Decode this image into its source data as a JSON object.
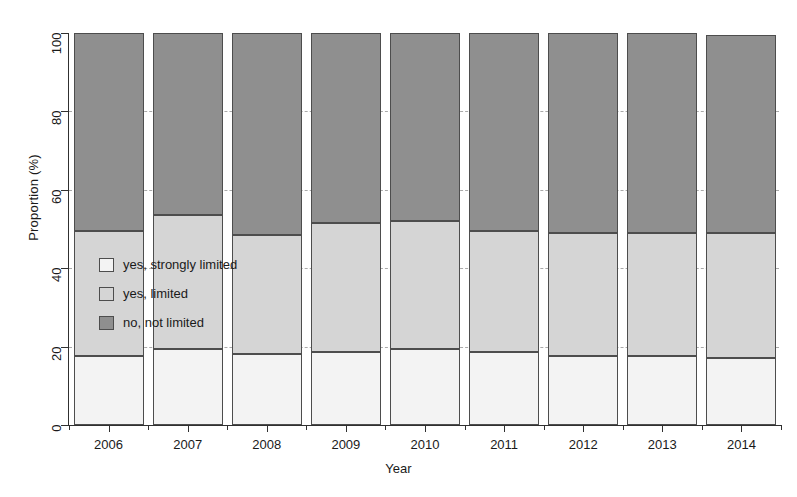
{
  "chart_data": {
    "type": "bar",
    "subtype": "stacked-percentage",
    "title": "",
    "xlabel": "Year",
    "ylabel": "Proportion (%)",
    "categories": [
      "2006",
      "2007",
      "2008",
      "2009",
      "2010",
      "2011",
      "2012",
      "2013",
      "2014"
    ],
    "ylim": [
      0,
      100
    ],
    "yticks": [
      0,
      20,
      40,
      60,
      80,
      100
    ],
    "ytick_labels": [
      "0",
      "20",
      "40",
      "60",
      "80",
      "100"
    ],
    "grid": "horizontal-dashed",
    "legend_position": "inside-left-middle",
    "series": [
      {
        "name": "yes, strongly limited",
        "color": "#f3f3f3",
        "values": [
          17.5,
          19.5,
          18.0,
          18.5,
          19.5,
          18.5,
          17.5,
          17.5,
          17.0
        ]
      },
      {
        "name": "yes, limited",
        "color": "#d5d5d5",
        "values": [
          32.0,
          34.0,
          30.5,
          33.0,
          32.5,
          31.0,
          31.5,
          31.5,
          32.0
        ]
      },
      {
        "name": "no, not limited",
        "color": "#8f8f8f",
        "values": [
          50.5,
          46.5,
          51.5,
          48.5,
          48.0,
          50.5,
          51.0,
          51.0,
          50.5
        ]
      }
    ],
    "stack_tops": {
      "2006": [
        17.5,
        49.5,
        100.0
      ],
      "2007": [
        19.5,
        53.5,
        100.0
      ],
      "2008": [
        18.0,
        48.5,
        100.0
      ],
      "2009": [
        18.5,
        51.5,
        100.0
      ],
      "2010": [
        19.5,
        52.0,
        100.0
      ],
      "2011": [
        18.5,
        49.5,
        100.0
      ],
      "2012": [
        17.5,
        49.0,
        100.0
      ],
      "2013": [
        17.5,
        49.0,
        100.0
      ],
      "2014": [
        17.0,
        49.0,
        99.5
      ]
    }
  },
  "axes": {
    "y_title": "Proportion (%)",
    "x_title": "Year",
    "y_ticks": [
      "0",
      "20",
      "40",
      "60",
      "80",
      "100"
    ],
    "x_ticks": [
      "2006",
      "2007",
      "2008",
      "2009",
      "2010",
      "2011",
      "2012",
      "2013",
      "2014"
    ]
  },
  "legend": {
    "items": [
      {
        "label": "yes, strongly limited",
        "color": "#f3f3f3"
      },
      {
        "label": "yes, limited",
        "color": "#d5d5d5"
      },
      {
        "label": "no, not limited",
        "color": "#8f8f8f"
      }
    ]
  }
}
